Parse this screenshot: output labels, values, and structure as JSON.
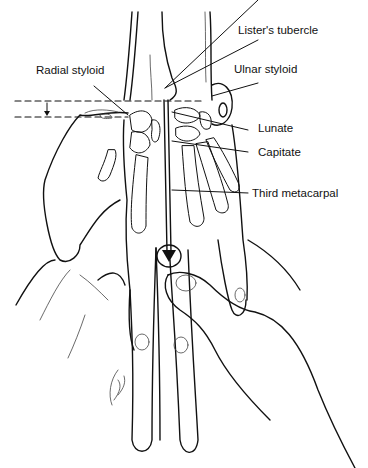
{
  "figure": {
    "labels": [
      {
        "id": "listers-tubercle",
        "text": "Lister's tubercle"
      },
      {
        "id": "radial-styloid",
        "text": "Radial styloid"
      },
      {
        "id": "ulnar-styloid",
        "text": "Ulnar styloid"
      },
      {
        "id": "lunate",
        "text": "Lunate"
      },
      {
        "id": "capitate",
        "text": "Capitate"
      },
      {
        "id": "third-metacarpal",
        "text": "Third metacarpal"
      }
    ],
    "signature": "C. Mac"
  }
}
